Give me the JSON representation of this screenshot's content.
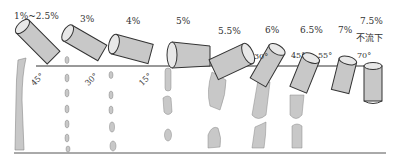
{
  "figure": {
    "stages": [
      {
        "concentration": "1%~2.5%",
        "tilt_angle": "45°"
      },
      {
        "concentration": "3%",
        "tilt_angle": "30°"
      },
      {
        "concentration": "4%",
        "tilt_angle": "15°"
      },
      {
        "concentration": "5%",
        "tilt_angle": ""
      },
      {
        "concentration": "5.5%",
        "tilt_angle": ""
      },
      {
        "concentration": "6%",
        "tilt_angle": "30°"
      },
      {
        "concentration": "6.5%",
        "tilt_angle": "45°"
      },
      {
        "concentration": "7%",
        "tilt_angle": "55°"
      },
      {
        "concentration": "7.5%",
        "tilt_angle": "70°",
        "note": "不流下"
      }
    ],
    "colors": {
      "liquid_fill": "#c8c8c8",
      "outline": "#333333",
      "baseline": "#444444"
    }
  }
}
